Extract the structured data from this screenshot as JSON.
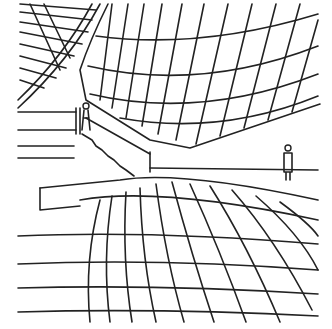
{
  "image": {
    "description": "Black ink architectural sketch of a curved auditorium interior with a ribbed ceiling, stairs, seating tiers and two human figures",
    "stroke_color": "#222222",
    "background": "#ffffff"
  }
}
